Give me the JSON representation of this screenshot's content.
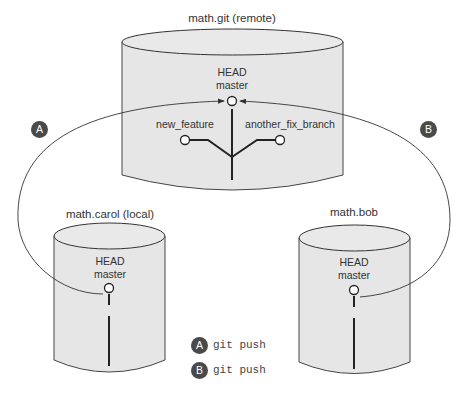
{
  "repos": {
    "remote": {
      "title": "math.git (remote)",
      "head_label": "HEAD",
      "branch_label": "master",
      "side_branches": [
        "new_feature",
        "another_fix_branch"
      ]
    },
    "carol": {
      "title": "math.carol (local)",
      "head_label": "HEAD",
      "branch_label": "master"
    },
    "bob": {
      "title": "math.bob",
      "head_label": "HEAD",
      "branch_label": "master"
    }
  },
  "arrows": {
    "a": {
      "badge": "A"
    },
    "b": {
      "badge": "B"
    }
  },
  "legend": [
    {
      "badge": "A",
      "command": "git push"
    },
    {
      "badge": "B",
      "command": "git push"
    }
  ],
  "colors": {
    "cylinder_fill": "#e6e6e6",
    "stroke": "#333333",
    "badge": "#4a4a4a"
  }
}
